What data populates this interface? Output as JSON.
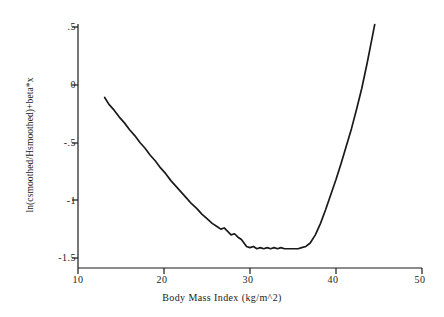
{
  "chart_data": {
    "type": "line",
    "title": "",
    "xlabel": "Body Mass Index (kg/m^2)",
    "ylabel": "ln(csmoothed/Hsmoothed)+beta*x",
    "xlim": [
      10,
      50
    ],
    "ylim": [
      -1.5,
      0.5
    ],
    "xticks": [
      10,
      20,
      30,
      40,
      50
    ],
    "xtick_labels": [
      "10",
      "20",
      "30",
      "40",
      "50"
    ],
    "yticks": [
      0.5,
      0,
      -0.5,
      -1,
      -1.5
    ],
    "ytick_labels": [
      ".5",
      "0",
      "-.5",
      "-1",
      "-1.5"
    ],
    "grid": false,
    "legend": null,
    "line_color": "#1a1a1a",
    "series": [
      {
        "name": "smoothed log hazard ratio",
        "x": [
          13.1,
          13.6,
          14.2,
          14.8,
          15.4,
          16.0,
          16.6,
          17.2,
          17.8,
          18.4,
          19.0,
          19.6,
          20.2,
          20.8,
          21.4,
          22.0,
          22.6,
          23.2,
          23.8,
          24.4,
          25.0,
          25.6,
          26.2,
          26.6,
          27.0,
          27.4,
          27.8,
          28.2,
          28.6,
          29.0,
          29.3,
          29.6,
          30.0,
          30.4,
          30.8,
          31.2,
          31.6,
          32.0,
          32.4,
          32.8,
          33.2,
          33.6,
          34.0,
          34.4,
          34.8,
          35.2,
          35.6,
          36.0,
          36.5,
          37.0,
          37.6,
          38.2,
          38.8,
          39.4,
          40.0,
          40.6,
          41.2,
          41.8,
          42.4,
          43.0,
          43.6,
          44.0,
          44.5
        ],
        "y": [
          -0.11,
          -0.17,
          -0.22,
          -0.28,
          -0.33,
          -0.39,
          -0.44,
          -0.5,
          -0.55,
          -0.61,
          -0.66,
          -0.72,
          -0.77,
          -0.83,
          -0.88,
          -0.93,
          -0.98,
          -1.03,
          -1.07,
          -1.12,
          -1.16,
          -1.2,
          -1.23,
          -1.25,
          -1.24,
          -1.27,
          -1.3,
          -1.29,
          -1.32,
          -1.34,
          -1.37,
          -1.4,
          -1.41,
          -1.4,
          -1.42,
          -1.41,
          -1.42,
          -1.41,
          -1.42,
          -1.41,
          -1.42,
          -1.41,
          -1.42,
          -1.42,
          -1.42,
          -1.42,
          -1.42,
          -1.41,
          -1.4,
          -1.37,
          -1.3,
          -1.2,
          -1.08,
          -0.95,
          -0.82,
          -0.68,
          -0.53,
          -0.38,
          -0.21,
          -0.03,
          0.18,
          0.33,
          0.52
        ]
      }
    ]
  },
  "axis": {
    "x_title": "Body Mass Index (kg/m^2)",
    "y_title": "ln(csmoothed/Hsmoothed)+beta*x",
    "x_labels": [
      "10",
      "20",
      "30",
      "40",
      "50"
    ],
    "y_labels": [
      ".5",
      "0",
      "-.5",
      "-1",
      "-1.5"
    ]
  }
}
